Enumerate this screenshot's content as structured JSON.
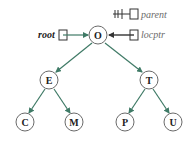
{
  "colors": {
    "edge": "#3f7a66",
    "node_stroke": "#6a6a6a",
    "pointer_stroke": "#333333",
    "label_gray": "#6b6b6b"
  },
  "pointers": {
    "root": {
      "label": "root",
      "target": "O"
    },
    "locptr": {
      "label": "locptr",
      "target": "O"
    },
    "parent": {
      "label": "parent",
      "target": "null"
    }
  },
  "tree": {
    "nodes": [
      {
        "id": "O",
        "label": "O",
        "x": 98,
        "y": 35
      },
      {
        "id": "E",
        "label": "E",
        "x": 49,
        "y": 80
      },
      {
        "id": "T",
        "label": "T",
        "x": 149,
        "y": 80
      },
      {
        "id": "C",
        "label": "C",
        "x": 25,
        "y": 122
      },
      {
        "id": "M",
        "label": "M",
        "x": 74,
        "y": 122
      },
      {
        "id": "P",
        "label": "P",
        "x": 125,
        "y": 122
      },
      {
        "id": "U",
        "label": "U",
        "x": 173,
        "y": 122
      }
    ],
    "edges": [
      {
        "from": "O",
        "to": "E"
      },
      {
        "from": "O",
        "to": "T"
      },
      {
        "from": "E",
        "to": "C"
      },
      {
        "from": "E",
        "to": "M"
      },
      {
        "from": "T",
        "to": "P"
      },
      {
        "from": "T",
        "to": "U"
      }
    ]
  }
}
